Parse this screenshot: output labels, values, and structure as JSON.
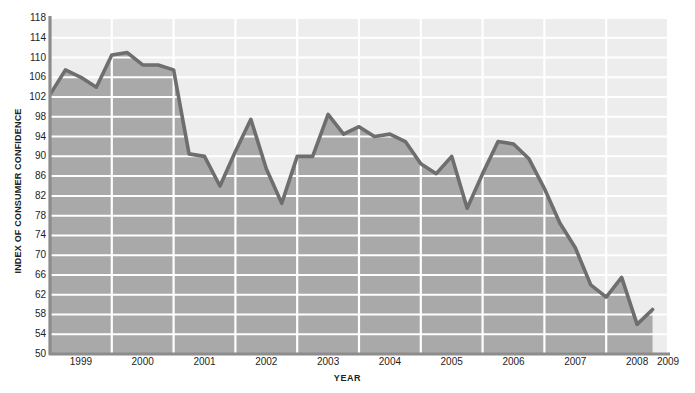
{
  "chart_data": {
    "type": "area",
    "title": "",
    "xlabel": "YEAR",
    "ylabel": "INDEX OF CONSUMER CONFIDENCE",
    "ylim": [
      50,
      118
    ],
    "xlim": [
      1999,
      2009
    ],
    "grid": true,
    "legend": null,
    "y_ticks": [
      50,
      54,
      58,
      62,
      66,
      70,
      74,
      78,
      82,
      86,
      90,
      94,
      98,
      102,
      106,
      110,
      114,
      118
    ],
    "x_ticks": [
      "1999",
      "2000",
      "2001",
      "2002",
      "2003",
      "2004",
      "2005",
      "2006",
      "2007",
      "2008",
      "2009"
    ],
    "x_tick_values": [
      1999,
      2000,
      2001,
      2002,
      2003,
      2004,
      2005,
      2006,
      2007,
      2008,
      2009
    ],
    "series": [
      {
        "name": "Index of Consumer Confidence",
        "x": [
          1999.0,
          1999.25,
          1999.5,
          1999.75,
          2000.0,
          2000.25,
          2000.5,
          2000.75,
          2001.0,
          2001.25,
          2001.5,
          2001.75,
          2002.0,
          2002.25,
          2002.5,
          2002.75,
          2003.0,
          2003.25,
          2003.5,
          2003.75,
          2004.0,
          2004.25,
          2004.5,
          2004.75,
          2005.0,
          2005.25,
          2005.5,
          2005.75,
          2006.0,
          2006.25,
          2006.5,
          2006.75,
          2007.0,
          2007.25,
          2007.5,
          2007.75,
          2008.0,
          2008.25,
          2008.5,
          2008.75
        ],
        "values": [
          102.5,
          107.5,
          106.0,
          104.0,
          110.5,
          111.0,
          108.5,
          108.5,
          107.5,
          90.5,
          90.0,
          84.0,
          91.0,
          97.5,
          87.5,
          80.5,
          90.0,
          90.0,
          98.5,
          94.5,
          96.0,
          94.0,
          94.5,
          93.0,
          88.5,
          86.5,
          90.0,
          79.5,
          86.5,
          93.0,
          92.5,
          89.5,
          83.5,
          76.5,
          71.5,
          64.0,
          61.5,
          65.5,
          56.0,
          59.0
        ]
      }
    ]
  },
  "axes": {
    "y_title": "INDEX OF CONSUMER CONFIDENCE",
    "x_title": "YEAR"
  },
  "colors": {
    "area_fill": "#a9a9a9",
    "upper_fill": "#ededed",
    "line": "#6e6e6e",
    "gridline": "#ffffff",
    "axis": "#8c8c8c",
    "text": "#1d1d1d",
    "background": "#ffffff"
  }
}
